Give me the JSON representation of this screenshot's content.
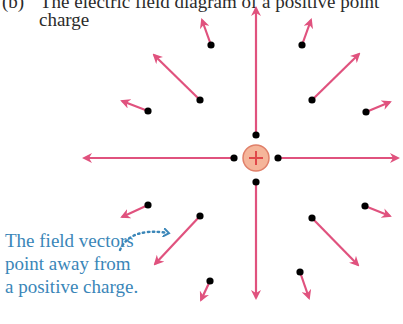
{
  "title": {
    "label": "(b)",
    "text": "The electric field diagram of a positive point",
    "continuation": "charge"
  },
  "charge": {
    "sign": "+",
    "center": [
      256,
      158
    ],
    "radius": 13,
    "fill_color": "#f5b59a",
    "stroke_color": "#e0806a",
    "sign_color": "#e0484a"
  },
  "colors": {
    "vector": "#e0527e",
    "dot": "#000000",
    "caption": "#3a86b8"
  },
  "vectors": [
    {
      "id": "up",
      "from": [
        256,
        135
      ],
      "to": [
        256,
        8
      ]
    },
    {
      "id": "down",
      "from": [
        256,
        182
      ],
      "to": [
        256,
        298
      ]
    },
    {
      "id": "left",
      "from": [
        234,
        158
      ],
      "to": [
        84,
        158
      ]
    },
    {
      "id": "right",
      "from": [
        278,
        158
      ],
      "to": [
        398,
        158
      ]
    },
    {
      "id": "upper-left-long",
      "from": [
        200,
        100
      ],
      "to": [
        154,
        55
      ]
    },
    {
      "id": "upper-left-short-top",
      "from": [
        211,
        45
      ],
      "to": [
        202,
        20
      ]
    },
    {
      "id": "upper-left-short-side",
      "from": [
        148,
        111
      ],
      "to": [
        122,
        101
      ]
    },
    {
      "id": "upper-right-short-top",
      "from": [
        302,
        45
      ],
      "to": [
        311,
        20
      ]
    },
    {
      "id": "upper-right-long",
      "from": [
        312,
        100
      ],
      "to": [
        359,
        54
      ]
    },
    {
      "id": "upper-right-short-side",
      "from": [
        366,
        112
      ],
      "to": [
        390,
        102
      ]
    },
    {
      "id": "lower-left-short-side",
      "from": [
        148,
        205
      ],
      "to": [
        122,
        217
      ]
    },
    {
      "id": "lower-left-long",
      "from": [
        200,
        216
      ],
      "to": [
        155,
        264
      ]
    },
    {
      "id": "lower-left-short-bottom",
      "from": [
        210,
        281
      ],
      "to": [
        201,
        300
      ]
    },
    {
      "id": "lower-right-short-side",
      "from": [
        365,
        206
      ],
      "to": [
        390,
        216
      ]
    },
    {
      "id": "lower-right-long",
      "from": [
        312,
        218
      ],
      "to": [
        358,
        265
      ]
    },
    {
      "id": "lower-right-short-bottom",
      "from": [
        300,
        272
      ],
      "to": [
        309,
        298
      ]
    }
  ],
  "caption": {
    "lines": [
      "The field vectors",
      "point away from",
      "a positive charge."
    ],
    "pointer_arrow": {
      "from": [
        120,
        250
      ],
      "to": [
        168,
        233
      ]
    }
  }
}
